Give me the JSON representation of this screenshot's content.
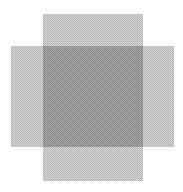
{
  "canvas": {
    "width": 183,
    "height": 192,
    "background": "#ffffff"
  },
  "shapes": [
    {
      "name": "vertical-rectangle",
      "x": 43,
      "y": 14,
      "width": 100,
      "height": 167,
      "fill": "#d6d6d6"
    },
    {
      "name": "horizontal-rectangle",
      "x": 11,
      "y": 46,
      "width": 163,
      "height": 101,
      "fill": "#d6d6d6"
    },
    {
      "name": "overlap-region",
      "x": 43,
      "y": 46,
      "width": 100,
      "height": 101,
      "fill": "#a9a9a9"
    }
  ]
}
